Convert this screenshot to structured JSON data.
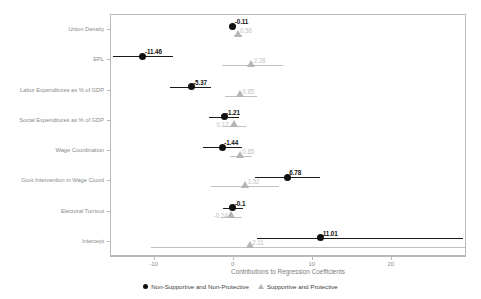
{
  "chart_data": {
    "type": "scatter",
    "title": "",
    "xlabel": "Contributions to Regression Coefficients",
    "ylabel": "",
    "xlim": [
      -15.5,
      29.5
    ],
    "xticks": [
      -10,
      0,
      10,
      20
    ],
    "xticklabels": [
      "-10",
      "0",
      "10",
      "20"
    ],
    "grid": false,
    "legend_position": "bottom",
    "categories": [
      "Union Density",
      "EPL",
      "Labor Expenditures as % of GDP",
      "Social Expenditures as % of GDP",
      "Wage Coordination",
      "Govt Intervention in Wage Coord",
      "Electoral Turnout",
      "Intercept"
    ],
    "series": [
      {
        "name": "Non-Supportive and Non-Protective",
        "marker": "circle",
        "color": "#111111",
        "values": [
          -0.11,
          -11.46,
          -5.37,
          -1.21,
          -1.44,
          6.78,
          -0.1,
          11.01
        ],
        "labels": [
          "-0.11",
          "-11.46",
          "-5.37",
          "-1.21",
          "-1.44",
          "6.78",
          "-0.1",
          "11.01"
        ],
        "ci_low": [
          -0.5,
          -15.2,
          -8.0,
          -3.1,
          -3.9,
          2.7,
          -1.4,
          3.0
        ],
        "ci_high": [
          0.3,
          -7.7,
          -2.8,
          0.7,
          1.0,
          10.9,
          1.2,
          29.0
        ]
      },
      {
        "name": "Supportive and Protective",
        "marker": "triangle",
        "color": "#b5b5b5",
        "values": [
          0.56,
          2.28,
          0.85,
          0.12,
          0.85,
          1.52,
          -0.24,
          2.11
        ],
        "labels": [
          "0.56",
          "2.28",
          "0.85",
          "0.12",
          "0.85",
          "1.52",
          "-0.24",
          "2.11"
        ],
        "ci_low": [
          0.1,
          -1.5,
          -1.1,
          -1.3,
          -0.5,
          -2.8,
          -1.6,
          -10.5
        ],
        "ci_high": [
          1.1,
          6.2,
          3.0,
          1.6,
          2.3,
          5.7,
          1.1,
          29.3
        ]
      }
    ]
  },
  "legend": {
    "items": [
      {
        "label": "Non-Supportive and Non-Protective",
        "marker": "circle-marker"
      },
      {
        "label": "Supportive and Protective",
        "marker": "triangle-marker"
      }
    ]
  }
}
